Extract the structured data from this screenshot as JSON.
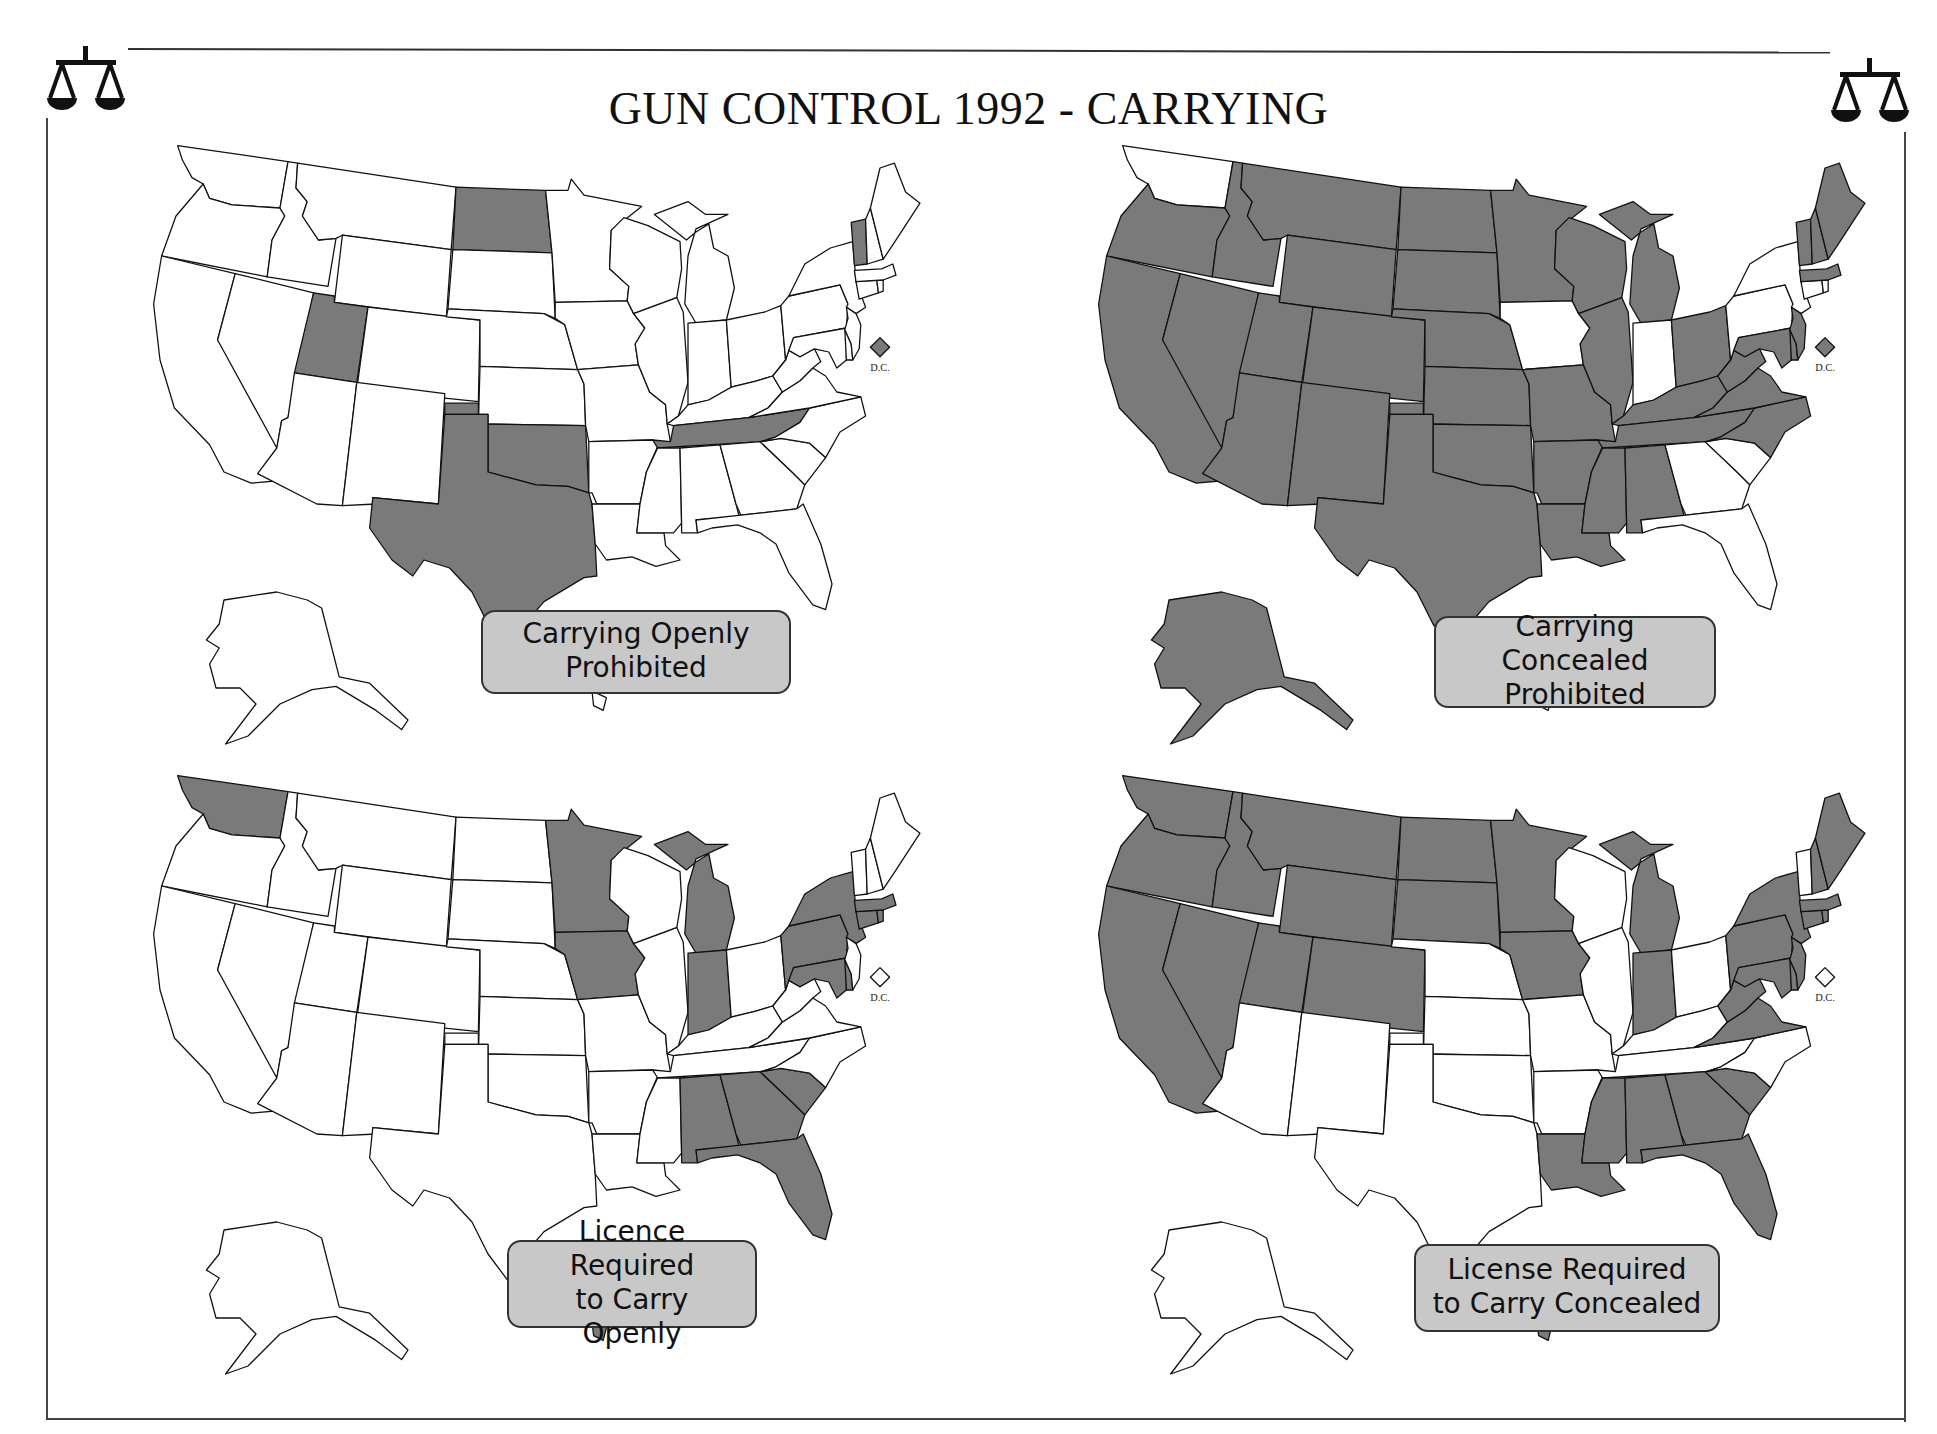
{
  "document": {
    "title": "GUN CONTROL 1992 - CARRYING",
    "icons": {
      "left": "scales-of-justice-icon",
      "right": "scales-of-justice-icon"
    }
  },
  "colors": {
    "shaded": "#7a7a7a",
    "unshaded": "#ffffff",
    "legend_bg": "#c8c8c8",
    "outline": "#111111"
  },
  "maps": [
    {
      "id": "carrying-openly-prohibited",
      "legend": {
        "line1": "Carrying Openly",
        "line2": "Prohibited"
      },
      "dc_label": "D.C.",
      "dc_shaded": true,
      "shaded_states": [
        "ND",
        "UT",
        "TX",
        "OK",
        "TN",
        "VT"
      ]
    },
    {
      "id": "carrying-concealed-prohibited",
      "legend": {
        "line1": "Carrying Concealed",
        "line2": "Prohibited"
      },
      "dc_label": "D.C.",
      "dc_shaded": true,
      "shaded_states": [
        "OR",
        "CA",
        "NV",
        "ID",
        "MT",
        "WY",
        "UT",
        "CO",
        "AZ",
        "NM",
        "ND",
        "SD",
        "NE",
        "KS",
        "OK",
        "TX",
        "MN",
        "WI",
        "MO",
        "AR",
        "LA",
        "IL",
        "MI",
        "OH",
        "KY",
        "TN",
        "MS",
        "AL",
        "WV",
        "VA",
        "NC",
        "MD",
        "DE",
        "VT",
        "NH",
        "ME",
        "MA",
        "AK",
        "NJ"
      ]
    },
    {
      "id": "licence-required-carry-openly",
      "legend": {
        "line1": "Licence Required",
        "line2": "to Carry Openly"
      },
      "dc_label": "D.C.",
      "dc_shaded": false,
      "shaded_states": [
        "WA",
        "MN",
        "IA",
        "MI",
        "IN",
        "NY",
        "PA",
        "MD",
        "MA",
        "CT",
        "RI",
        "AL",
        "GA",
        "SC",
        "FL",
        "HI",
        "DE"
      ]
    },
    {
      "id": "license-required-carry-concealed",
      "legend": {
        "line1": "License Required",
        "line2": "to Carry Concealed"
      },
      "dc_label": "D.C.",
      "dc_shaded": false,
      "shaded_states": [
        "WA",
        "OR",
        "CA",
        "NV",
        "ID",
        "MT",
        "WY",
        "UT",
        "CO",
        "ND",
        "SD",
        "MN",
        "IA",
        "MI",
        "IN",
        "WV",
        "VA",
        "PA",
        "NY",
        "NJ",
        "DE",
        "MD",
        "CT",
        "RI",
        "MA",
        "NH",
        "ME",
        "LA",
        "MS",
        "AL",
        "GA",
        "SC",
        "FL",
        "HI"
      ]
    }
  ]
}
